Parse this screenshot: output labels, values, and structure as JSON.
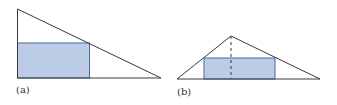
{
  "figures": [
    {
      "label": "(a)",
      "description": "right triangle with inscribed rectangle"
    },
    {
      "label": "(b)",
      "description": "triangle with inscribed rectangle and dashed altitude"
    }
  ],
  "colors": {
    "stroke": "#3a3a3a",
    "fill": "#bccbe6",
    "rect_stroke": "#4a6aa0"
  }
}
